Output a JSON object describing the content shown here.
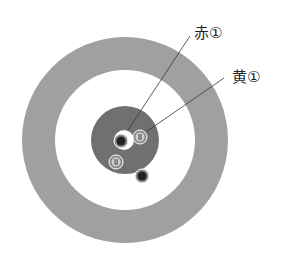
{
  "diagram": {
    "type": "curling-house",
    "labels": [
      {
        "id": "red1",
        "text": "赤①",
        "x": 185,
        "y": 27
      },
      {
        "id": "yellow1",
        "text": "黄①",
        "x": 232,
        "y": 70
      }
    ],
    "colors": {
      "outer_ring": "#a0a0a0",
      "button": "#707070",
      "red_stone": "#222222",
      "yellow_stone": "#b9b9b9",
      "leader_line": "#333333"
    }
  }
}
